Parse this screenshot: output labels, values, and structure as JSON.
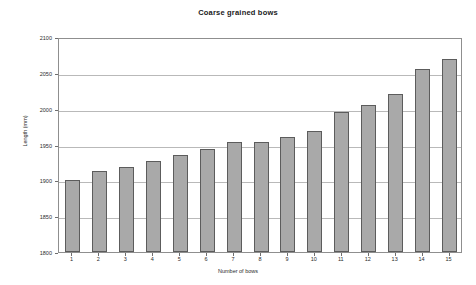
{
  "chart_data": {
    "type": "bar",
    "title": "Coarse grained bows",
    "xlabel": "Number of bows",
    "ylabel": "Length (mm)",
    "categories": [
      "1",
      "2",
      "3",
      "4",
      "5",
      "6",
      "7",
      "8",
      "9",
      "10",
      "11",
      "12",
      "13",
      "14",
      "15"
    ],
    "values": [
      1900,
      1913,
      1918,
      1927,
      1935,
      1944,
      1954,
      1954,
      1960,
      1969,
      1995,
      2005,
      2021,
      2055,
      2070
    ],
    "ylim": [
      1800,
      2100
    ],
    "ytick_values": [
      1800,
      1850,
      1900,
      1950,
      2000,
      2050,
      2100
    ],
    "ytick_labels": [
      "1800",
      "1850",
      "1900",
      "1950",
      "2000",
      "2050",
      "2100"
    ],
    "grid": true,
    "legend": "none",
    "series": [
      {
        "name": "Length",
        "values": [
          1900,
          1913,
          1918,
          1927,
          1935,
          1944,
          1954,
          1954,
          1960,
          1969,
          1995,
          2005,
          2021,
          2055,
          2070
        ]
      }
    ],
    "colors": {
      "bar_fill": "#a9a9a9",
      "bar_border": "#5c5c5c",
      "gridline": "#b9b9b9",
      "axis": "#8f8f8f",
      "text": "#2b2b2b",
      "background": "#ffffff"
    }
  }
}
